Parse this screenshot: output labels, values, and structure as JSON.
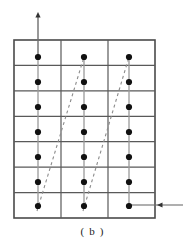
{
  "figure": {
    "caption": "( b )",
    "kind": "lattice-grid-diagram",
    "canvas": {
      "width": 185,
      "height": 251
    },
    "colors": {
      "background": "#ffffff",
      "grid_line": "#595959",
      "grid_border": "#4a4a4a",
      "dot": "#111111",
      "connector": "#9a9a9a",
      "dashed_line": "#8c8c8c",
      "arrow": "#6e6e6e",
      "caption_text": "#222222"
    },
    "grid": {
      "x": 14,
      "y": 40,
      "width": 141,
      "height": 178,
      "rows": 7,
      "columns": 3,
      "row_height": 25.43,
      "column_width": 47.0,
      "column_separators_x": [
        61,
        108
      ],
      "row_separators_y": [
        65.4,
        90.9,
        116.3,
        141.7,
        167.1,
        192.6
      ],
      "border_width": 1.6,
      "inner_line_width": 1.2
    },
    "dots": {
      "radius": 3.1,
      "count": 21,
      "columns_x": [
        38,
        84,
        129
      ],
      "rows_y": [
        57,
        82,
        107,
        132,
        157,
        182,
        206
      ],
      "points": [
        {
          "col": 0,
          "row": 0,
          "x": 38,
          "y": 57
        },
        {
          "col": 0,
          "row": 1,
          "x": 38,
          "y": 82
        },
        {
          "col": 0,
          "row": 2,
          "x": 38,
          "y": 107
        },
        {
          "col": 0,
          "row": 3,
          "x": 38,
          "y": 132
        },
        {
          "col": 0,
          "row": 4,
          "x": 38,
          "y": 157
        },
        {
          "col": 0,
          "row": 5,
          "x": 38,
          "y": 182
        },
        {
          "col": 0,
          "row": 6,
          "x": 38,
          "y": 206
        },
        {
          "col": 1,
          "row": 0,
          "x": 84,
          "y": 57
        },
        {
          "col": 1,
          "row": 1,
          "x": 84,
          "y": 82
        },
        {
          "col": 1,
          "row": 2,
          "x": 84,
          "y": 107
        },
        {
          "col": 1,
          "row": 3,
          "x": 84,
          "y": 132
        },
        {
          "col": 1,
          "row": 4,
          "x": 84,
          "y": 157
        },
        {
          "col": 1,
          "row": 5,
          "x": 84,
          "y": 182
        },
        {
          "col": 1,
          "row": 6,
          "x": 84,
          "y": 206
        },
        {
          "col": 2,
          "row": 0,
          "x": 129,
          "y": 57
        },
        {
          "col": 2,
          "row": 1,
          "x": 129,
          "y": 82
        },
        {
          "col": 2,
          "row": 2,
          "x": 129,
          "y": 107
        },
        {
          "col": 2,
          "row": 3,
          "x": 129,
          "y": 132
        },
        {
          "col": 2,
          "row": 4,
          "x": 129,
          "y": 157
        },
        {
          "col": 2,
          "row": 5,
          "x": 129,
          "y": 182
        },
        {
          "col": 2,
          "row": 6,
          "x": 129,
          "y": 206
        }
      ]
    },
    "connectors": [
      {
        "x": 38,
        "y1": 57,
        "y2": 206
      },
      {
        "x": 84,
        "y1": 57,
        "y2": 206
      },
      {
        "x": 129,
        "y1": 57,
        "y2": 206
      }
    ],
    "dashed_lines": [
      {
        "x1": 37,
        "y1": 211,
        "x2": 84,
        "y2": 57,
        "dash": "3 3"
      },
      {
        "x1": 83,
        "y1": 211,
        "x2": 129,
        "y2": 57,
        "dash": "3 3"
      }
    ],
    "arrows": [
      {
        "name": "vertical-up-arrow",
        "direction": "up",
        "x1": 38,
        "y1": 57,
        "x2": 38,
        "y2": 12
      },
      {
        "name": "horizontal-left-arrow",
        "direction": "left",
        "x1": 183,
        "y1": 205,
        "x2": 129,
        "y2": 205,
        "head_x": 157,
        "head_y": 205
      }
    ]
  }
}
